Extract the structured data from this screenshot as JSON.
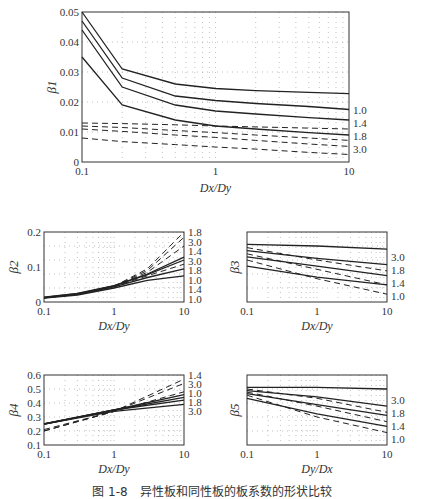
{
  "caption": "图 1-8　异性板和同性板的板系数的形状比较",
  "chart_data": [
    {
      "id": "beta1",
      "type": "line",
      "ylabel": "β1",
      "xlabel": "Dx/Dy",
      "xscale": "log",
      "xlim": [
        0.1,
        10
      ],
      "ylim": [
        0,
        0.05
      ],
      "xticks": [
        "0.1",
        "1",
        "10"
      ],
      "yticks": [
        "0",
        "0.01",
        "0.02",
        "0.03",
        "0.04",
        "0.05"
      ],
      "grid": "dotted",
      "x": [
        0.1,
        0.2,
        0.5,
        1,
        2,
        5,
        10
      ],
      "series": [
        {
          "name": "1.0",
          "style": "solid",
          "values": [
            0.05,
            0.031,
            0.026,
            0.0245,
            0.0238,
            0.0232,
            0.0228
          ]
        },
        {
          "name": "1.4",
          "style": "solid",
          "values": [
            0.047,
            0.028,
            0.022,
            0.0205,
            0.0195,
            0.0185,
            0.0175
          ]
        },
        {
          "name": "1.8",
          "style": "solid",
          "values": [
            0.044,
            0.025,
            0.019,
            0.017,
            0.016,
            0.0148,
            0.014
          ]
        },
        {
          "name": "3.0",
          "style": "solid",
          "values": [
            0.035,
            0.019,
            0.014,
            0.012,
            0.011,
            0.0098,
            0.009
          ]
        },
        {
          "name": "1.0",
          "style": "dashed",
          "values": [
            0.013,
            0.0128,
            0.0124,
            0.012,
            0.0117,
            0.0113,
            0.011
          ]
        },
        {
          "name": "1.4",
          "style": "dashed",
          "values": [
            0.012,
            0.0115,
            0.0105,
            0.0098,
            0.009,
            0.008,
            0.0072
          ]
        },
        {
          "name": "1.8",
          "style": "dashed",
          "values": [
            0.011,
            0.0102,
            0.009,
            0.0082,
            0.0072,
            0.006,
            0.0052
          ]
        },
        {
          "name": "3.0",
          "style": "dashed",
          "values": [
            0.008,
            0.0068,
            0.0058,
            0.005,
            0.0043,
            0.0032,
            0.0025
          ]
        }
      ],
      "right_labels": [
        "1.0",
        "1.4",
        "1.8",
        "3.0"
      ],
      "inline_labels": [
        "1.0",
        "1.4",
        "1.8",
        "3.0"
      ]
    },
    {
      "id": "beta2",
      "type": "line",
      "ylabel": "β2",
      "xlabel": "Dx/Dy",
      "xscale": "log",
      "xlim": [
        0.1,
        10
      ],
      "ylim": [
        0,
        0.2
      ],
      "xticks": [
        "0.1",
        "1",
        "10"
      ],
      "yticks": [
        "0",
        "0.1",
        "0.2"
      ],
      "grid": "dotted",
      "x": [
        0.1,
        0.3,
        1,
        3,
        10
      ],
      "series": [
        {
          "name": "1.8",
          "style": "dashed",
          "values": [
            0.012,
            0.022,
            0.045,
            0.095,
            0.2
          ]
        },
        {
          "name": "3.0",
          "style": "dashed",
          "values": [
            0.012,
            0.022,
            0.045,
            0.09,
            0.185
          ]
        },
        {
          "name": "1.4",
          "style": "dashed",
          "values": [
            0.012,
            0.022,
            0.045,
            0.085,
            0.16
          ]
        },
        {
          "name": "3.0",
          "style": "solid",
          "values": [
            0.014,
            0.025,
            0.047,
            0.08,
            0.128
          ]
        },
        {
          "name": "1.8",
          "style": "solid",
          "values": [
            0.013,
            0.024,
            0.046,
            0.078,
            0.12
          ]
        },
        {
          "name": "1.0",
          "style": "dashed",
          "values": [
            0.012,
            0.022,
            0.044,
            0.075,
            0.108
          ]
        },
        {
          "name": "1.4",
          "style": "solid",
          "values": [
            0.012,
            0.022,
            0.043,
            0.07,
            0.095
          ]
        },
        {
          "name": "1.0",
          "style": "solid",
          "values": [
            0.011,
            0.02,
            0.04,
            0.062,
            0.075
          ]
        }
      ],
      "right_labels": [
        "1.8",
        "3.0",
        "1.4",
        "3.0",
        "1.8",
        "1.0",
        "1.4",
        "1.0"
      ]
    },
    {
      "id": "beta3",
      "type": "line",
      "ylabel": "β3",
      "xlabel": "Dx/Dy",
      "xscale": "log",
      "xlim": [
        0.1,
        10
      ],
      "xticks": [
        "0.1",
        "1",
        "10"
      ],
      "grid": "dotted",
      "x": [
        0.1,
        1,
        10
      ],
      "series": [
        {
          "name": "3.0",
          "style": "solid",
          "values": [
            0.62,
            0.61,
            0.59
          ]
        },
        {
          "name": "1.8",
          "style": "solid",
          "values": [
            0.58,
            0.53,
            0.49
          ]
        },
        {
          "name": "1.8",
          "style": "dashed",
          "values": [
            0.6,
            0.52,
            0.45
          ]
        },
        {
          "name": "1.4",
          "style": "solid",
          "values": [
            0.54,
            0.48,
            0.42
          ]
        },
        {
          "name": "1.4",
          "style": "dashed",
          "values": [
            0.56,
            0.46,
            0.36
          ]
        },
        {
          "name": "1.0",
          "style": "solid",
          "values": [
            0.48,
            0.41,
            0.36
          ]
        },
        {
          "name": "1.0",
          "style": "dashed",
          "values": [
            0.52,
            0.4,
            0.3
          ]
        }
      ],
      "right_labels": [
        "3.0",
        "1.8",
        "1.4",
        "1.0"
      ]
    },
    {
      "id": "beta4",
      "type": "line",
      "ylabel": "β4",
      "xlabel": "Dx/Dy",
      "xscale": "log",
      "xlim": [
        0.1,
        10
      ],
      "ylim": [
        0.1,
        0.6
      ],
      "xticks": [
        "0.1",
        "1",
        "10"
      ],
      "yticks": [
        "0.1",
        "0.2",
        "0.3",
        "0.4",
        "0.5",
        "0.6"
      ],
      "grid": "dotted",
      "x": [
        0.1,
        1,
        10
      ],
      "series": [
        {
          "name": "1.4",
          "style": "dashed",
          "values": [
            0.2,
            0.34,
            0.57
          ]
        },
        {
          "name": "3.0",
          "style": "dashed",
          "values": [
            0.2,
            0.34,
            0.54
          ]
        },
        {
          "name": "1.0",
          "style": "dashed",
          "values": [
            0.21,
            0.34,
            0.48
          ]
        },
        {
          "name": "1.8",
          "style": "solid",
          "values": [
            0.25,
            0.35,
            0.46
          ]
        },
        {
          "name": "3.0",
          "style": "solid",
          "values": [
            0.25,
            0.35,
            0.44
          ]
        },
        {
          "name": "1.4",
          "style": "solid",
          "values": [
            0.25,
            0.35,
            0.42
          ]
        },
        {
          "name": "1.0",
          "style": "solid",
          "values": [
            0.25,
            0.34,
            0.39
          ]
        }
      ],
      "right_labels": [
        "1.4",
        "3.0",
        "1.0",
        "1.8",
        "3.0"
      ],
      "inline_labels": [
        "1.8",
        "1.0",
        "1.4"
      ]
    },
    {
      "id": "beta5",
      "type": "line",
      "ylabel": "β5",
      "xlabel": "Dy/Dx",
      "xscale": "log",
      "xlim": [
        0.1,
        10
      ],
      "xticks": [
        "0.1",
        "1",
        "10"
      ],
      "grid": "dotted",
      "x": [
        0.1,
        1,
        10
      ],
      "series": [
        {
          "name": "3.0",
          "style": "solid",
          "values": [
            0.62,
            0.62,
            0.61
          ]
        },
        {
          "name": "1.8",
          "style": "solid",
          "values": [
            0.6,
            0.56,
            0.5
          ]
        },
        {
          "name": "1.8",
          "style": "dashed",
          "values": [
            0.61,
            0.55,
            0.46
          ]
        },
        {
          "name": "1.4",
          "style": "solid",
          "values": [
            0.58,
            0.51,
            0.44
          ]
        },
        {
          "name": "1.4",
          "style": "dashed",
          "values": [
            0.59,
            0.5,
            0.4
          ]
        },
        {
          "name": "1.0",
          "style": "solid",
          "values": [
            0.55,
            0.45,
            0.37
          ]
        },
        {
          "name": "1.0",
          "style": "dashed",
          "values": [
            0.57,
            0.43,
            0.33
          ]
        }
      ],
      "right_labels": [
        "3.0",
        "1.8",
        "1.4",
        "1.0"
      ]
    }
  ]
}
